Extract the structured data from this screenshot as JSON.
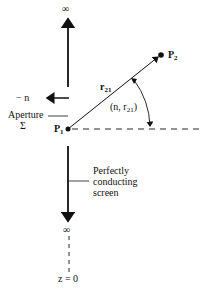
{
  "diagram": {
    "top_infinity": "∞",
    "bottom_infinity": "∞",
    "neg_n_label": "− n",
    "aperture_label": "Aperture",
    "sigma_label": "Σ",
    "p1_label": "P",
    "p1_sub": "1",
    "p2_label": "P",
    "p2_sub": "2",
    "r21_label": "r",
    "r21_sub": "21",
    "angle_label_prefix": "(n, r",
    "angle_label_sub": "21",
    "angle_label_suffix": ")",
    "screen_label_line1": "Perfectly",
    "screen_label_line2": "conducting",
    "screen_label_line3": "screen",
    "z_label": "z = 0"
  }
}
